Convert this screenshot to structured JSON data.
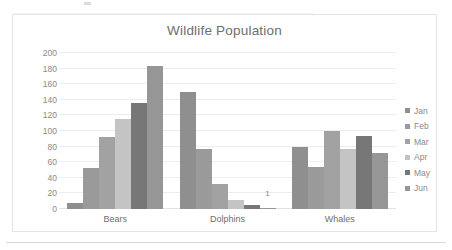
{
  "chart_data": {
    "type": "bar",
    "title": "Wildlife Population",
    "xlabel": "",
    "ylabel": "",
    "ylim": [
      0,
      200
    ],
    "ytick_step": 20,
    "yticks": [
      0,
      20,
      40,
      60,
      80,
      100,
      120,
      140,
      160,
      180,
      200
    ],
    "grid": "horizontal",
    "legend_position": "right",
    "categories": [
      "Bears",
      "Dolphins",
      "Whales"
    ],
    "series": [
      {
        "name": "Jan",
        "color": "#8f8f8f",
        "values": [
          8,
          150,
          80
        ]
      },
      {
        "name": "Feb",
        "color": "#9a9a9a",
        "values": [
          53,
          77,
          54
        ]
      },
      {
        "name": "Mar",
        "color": "#a2a2a2",
        "values": [
          92,
          32,
          100
        ]
      },
      {
        "name": "Apr",
        "color": "#c4c4c4",
        "values": [
          115,
          11,
          77
        ]
      },
      {
        "name": "May",
        "color": "#777777",
        "values": [
          136,
          5,
          93
        ]
      },
      {
        "name": "Jun",
        "color": "#969696",
        "values": [
          183,
          1,
          72
        ]
      }
    ],
    "data_labels": [
      {
        "category": "Dolphins",
        "series": "Jun",
        "text": "1"
      }
    ]
  },
  "colors": {
    "title_text": "#6e6e6e",
    "axis_text": "#8a8a8a",
    "category_text": "#6e6e6e",
    "gridline": "#ededed",
    "frame_border": "#e4e4e4",
    "background": "#ffffff"
  }
}
